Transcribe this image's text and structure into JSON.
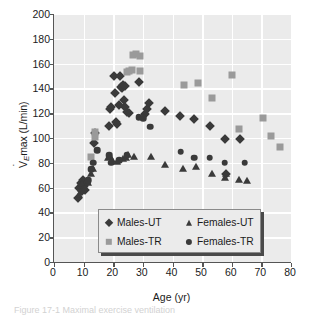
{
  "figure": {
    "background_color": "#ffffff",
    "plot_background_color": "#ebebeb",
    "gridline_color": "#ffffff",
    "axis_color": "#555555",
    "caption": "Figure 17-1   Maximal exercise ventilation"
  },
  "chart_data": {
    "type": "scatter",
    "title": "",
    "xlabel": "Age (yr)",
    "ylabel": "V̇Emax (L/min)",
    "ylabel_parts": {
      "symbol": "V",
      "subscript": "E",
      "rest": "max (L/min)"
    },
    "xlim": [
      0,
      80
    ],
    "ylim": [
      0,
      200
    ],
    "xticks": [
      0,
      10,
      20,
      30,
      40,
      50,
      60,
      70,
      80
    ],
    "yticks": [
      0,
      20,
      40,
      60,
      80,
      100,
      120,
      140,
      160,
      180,
      200
    ],
    "grid": true,
    "legend_position": "bottom-center-inside",
    "series": [
      {
        "name": "Males-UT",
        "marker": "diamond",
        "color": "#3a3a3a",
        "points": [
          [
            8.2,
            52
          ],
          [
            8.6,
            60
          ],
          [
            9.0,
            64
          ],
          [
            9.3,
            57
          ],
          [
            9.5,
            62
          ],
          [
            9.8,
            66
          ],
          [
            10.2,
            61
          ],
          [
            10.5,
            58
          ],
          [
            10.8,
            64
          ],
          [
            13.6,
            96
          ],
          [
            14.0,
            104
          ],
          [
            18.6,
            110
          ],
          [
            18.9,
            123
          ],
          [
            19.2,
            125
          ],
          [
            20.1,
            150
          ],
          [
            20.6,
            136
          ],
          [
            21.0,
            113
          ],
          [
            21.3,
            111
          ],
          [
            21.8,
            127
          ],
          [
            22.2,
            150
          ],
          [
            22.6,
            141
          ],
          [
            22.9,
            140
          ],
          [
            23.2,
            143
          ],
          [
            23.5,
            131
          ],
          [
            23.8,
            125
          ],
          [
            24.1,
            142
          ],
          [
            24.6,
            121
          ],
          [
            25.2,
            120
          ],
          [
            28.6,
            145
          ],
          [
            30.6,
            119
          ],
          [
            31.4,
            123
          ],
          [
            32.2,
            128
          ],
          [
            37.4,
            122
          ],
          [
            42.6,
            118
          ],
          [
            47.4,
            115
          ],
          [
            52.6,
            110
          ],
          [
            57.6,
            99
          ],
          [
            58.2,
            71
          ],
          [
            62.8,
            99
          ]
        ]
      },
      {
        "name": "Males-TR",
        "marker": "square",
        "color": "#9a9a9a",
        "points": [
          [
            12.6,
            85
          ],
          [
            13.9,
            105
          ],
          [
            13.9,
            101
          ],
          [
            24.6,
            153
          ],
          [
            25.2,
            154
          ],
          [
            26.2,
            155
          ],
          [
            26.6,
            167
          ],
          [
            27.8,
            168
          ],
          [
            28.9,
            166
          ],
          [
            28.9,
            154
          ],
          [
            44.0,
            143
          ],
          [
            48.6,
            144
          ],
          [
            53.4,
            132
          ],
          [
            60.2,
            151
          ],
          [
            62.6,
            107
          ],
          [
            70.4,
            116
          ],
          [
            73.2,
            102
          ],
          [
            76.4,
            93
          ]
        ]
      },
      {
        "name": "Females-UT",
        "marker": "triangle",
        "color": "#3a3a3a",
        "points": [
          [
            8.4,
            54
          ],
          [
            9.0,
            61
          ],
          [
            9.4,
            63
          ],
          [
            9.8,
            59
          ],
          [
            10.4,
            60
          ],
          [
            11.0,
            65
          ],
          [
            11.4,
            64
          ],
          [
            12.6,
            71
          ],
          [
            13.2,
            75
          ],
          [
            18.2,
            84
          ],
          [
            18.8,
            85
          ],
          [
            19.6,
            82
          ],
          [
            21.4,
            81
          ],
          [
            23.2,
            83
          ],
          [
            24.4,
            84
          ],
          [
            25.0,
            86
          ],
          [
            27.0,
            85
          ],
          [
            32.8,
            85
          ],
          [
            37.6,
            78
          ],
          [
            43.4,
            75
          ],
          [
            47.8,
            77
          ],
          [
            53.2,
            71
          ],
          [
            57.6,
            68
          ],
          [
            58.2,
            71
          ],
          [
            62.6,
            66
          ],
          [
            65.0,
            65
          ]
        ]
      },
      {
        "name": "Females-TR",
        "marker": "circle",
        "color": "#3a3a3a",
        "points": [
          [
            11.6,
            66
          ],
          [
            12.6,
            75
          ],
          [
            13.2,
            80
          ],
          [
            14.6,
            90
          ],
          [
            18.6,
            86
          ],
          [
            19.4,
            80
          ],
          [
            22.0,
            82
          ],
          [
            24.6,
            86
          ],
          [
            28.6,
            117
          ],
          [
            30.2,
            116
          ],
          [
            32.4,
            109
          ],
          [
            42.8,
            89
          ],
          [
            47.4,
            84
          ],
          [
            52.6,
            84
          ],
          [
            57.6,
            80
          ],
          [
            64.4,
            80
          ]
        ]
      }
    ]
  },
  "legend": {
    "items": [
      {
        "label": "Males-UT",
        "marker": "diamond"
      },
      {
        "label": "Females-UT",
        "marker": "triangle"
      },
      {
        "label": "Males-TR",
        "marker": "square"
      },
      {
        "label": "Females-TR",
        "marker": "circle"
      }
    ]
  }
}
